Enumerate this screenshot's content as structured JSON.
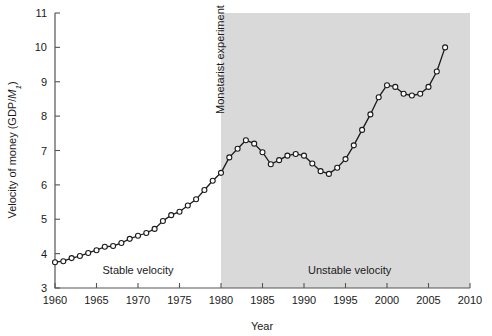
{
  "chart_data": {
    "type": "line",
    "title": "",
    "xlabel": "Year",
    "ylabel": "Velocity of money (GDP/M₁)",
    "xlim": [
      1960,
      2010
    ],
    "ylim": [
      3,
      11
    ],
    "xticks": [
      1960,
      1965,
      1970,
      1975,
      1980,
      1985,
      1990,
      1995,
      2000,
      2005,
      2010
    ],
    "yticks": [
      3,
      4,
      5,
      6,
      7,
      8,
      9,
      10,
      11
    ],
    "grid": false,
    "legend": "none",
    "marker": "open-circle",
    "line_color": "#1a1a1a",
    "marker_fill": "#ffffff",
    "shaded_region": {
      "label": "Monetarist experiment",
      "x_start": 1980,
      "x_end": 2010,
      "color": "#d9d9d9"
    },
    "annotations": [
      {
        "text": "Stable velocity",
        "x": 1970,
        "y": 3.4
      },
      {
        "text": "Unstable velocity",
        "x": 1995.5,
        "y": 3.4
      }
    ],
    "x": [
      1960,
      1961,
      1962,
      1963,
      1964,
      1965,
      1966,
      1967,
      1968,
      1969,
      1970,
      1971,
      1972,
      1973,
      1974,
      1975,
      1976,
      1977,
      1978,
      1979,
      1980,
      1981,
      1982,
      1983,
      1984,
      1985,
      1986,
      1987,
      1988,
      1989,
      1990,
      1991,
      1992,
      1993,
      1994,
      1995,
      1996,
      1997,
      1998,
      1999,
      2000,
      2001,
      2002,
      2003,
      2004,
      2005,
      2006,
      2007
    ],
    "values": [
      3.75,
      3.78,
      3.87,
      3.93,
      4.02,
      4.1,
      4.2,
      4.22,
      4.31,
      4.43,
      4.52,
      4.6,
      4.72,
      4.95,
      5.12,
      5.22,
      5.4,
      5.58,
      5.85,
      6.12,
      6.35,
      6.8,
      7.05,
      7.3,
      7.2,
      6.95,
      6.6,
      6.72,
      6.85,
      6.9,
      6.85,
      6.62,
      6.4,
      6.32,
      6.5,
      6.75,
      7.15,
      7.6,
      8.05,
      8.55,
      8.9,
      8.85,
      8.65,
      8.6,
      8.65,
      8.85,
      9.3,
      10.0
    ]
  },
  "figure": {
    "background": "#ffffff",
    "plot_left_px": 55,
    "plot_right_px": 470,
    "plot_top_px": 13,
    "plot_bottom_px": 288
  }
}
